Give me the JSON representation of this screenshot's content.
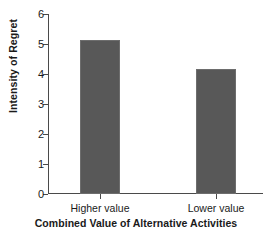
{
  "chart_data": {
    "type": "bar",
    "title": "",
    "xlabel": "Combined Value of Alternative Activities",
    "ylabel": "Intensity of Regret",
    "categories": [
      "Higher value",
      "Lower value"
    ],
    "values": [
      5.12,
      4.18
    ],
    "ylim": [
      0,
      6
    ],
    "yticks": [
      0,
      1,
      2,
      3,
      4,
      5,
      6
    ],
    "ytick_labels": [
      "0",
      "1",
      "2",
      "3",
      "4",
      "5",
      "6"
    ],
    "grid": false,
    "legend": false,
    "bar_color": "#585858",
    "axis_color": "#4a4a4a",
    "text_color": "#1a1a1a",
    "background": "#ffffff"
  }
}
